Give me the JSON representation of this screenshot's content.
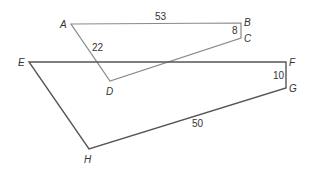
{
  "diagram": {
    "quadrilaterals": [
      {
        "name": "ABCD",
        "stroke": "#8a8a8a",
        "vertices": [
          {
            "label": "A",
            "x": 71,
            "y": 24,
            "lx": 60,
            "ly": 28
          },
          {
            "label": "B",
            "x": 241,
            "y": 23,
            "lx": 244,
            "ly": 26
          },
          {
            "label": "C",
            "x": 241,
            "y": 38,
            "lx": 244,
            "ly": 42
          },
          {
            "label": "D",
            "x": 110,
            "y": 81,
            "lx": 106,
            "ly": 95
          }
        ],
        "side_labels": [
          {
            "side": "AB",
            "text": "53",
            "x": 155,
            "y": 20
          },
          {
            "side": "BC",
            "text": "8",
            "x": 232,
            "y": 34
          },
          {
            "side": "AD",
            "text": "22",
            "x": 92,
            "y": 51
          }
        ]
      },
      {
        "name": "EFGH",
        "stroke": "#555555",
        "vertices": [
          {
            "label": "E",
            "x": 29,
            "y": 62,
            "lx": 18,
            "ly": 66
          },
          {
            "label": "F",
            "x": 286,
            "y": 62,
            "lx": 289,
            "ly": 66
          },
          {
            "label": "G",
            "x": 286,
            "y": 88,
            "lx": 289,
            "ly": 92
          },
          {
            "label": "H",
            "x": 89,
            "y": 149,
            "lx": 84,
            "ly": 163
          }
        ],
        "side_labels": [
          {
            "side": "FG",
            "text": "10",
            "x": 273,
            "y": 79
          },
          {
            "side": "GH",
            "text": "50",
            "x": 192,
            "y": 127
          }
        ]
      }
    ]
  }
}
